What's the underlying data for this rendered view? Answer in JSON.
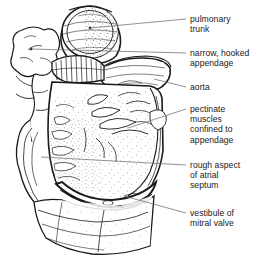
{
  "figure": {
    "width": 272,
    "height": 263,
    "background_color": "#ffffff",
    "ink_color": "#1a1a1a",
    "stipple_color": "#55555a",
    "leader_color": "#6e6e73"
  },
  "labels": [
    {
      "id": "pulmonary-trunk",
      "text": "pulmonary\ntrunk",
      "lines": [
        "pulmonary",
        "trunk"
      ],
      "x": 190,
      "y": 14,
      "leader": {
        "x1": 186,
        "y1": 19,
        "x2": 90,
        "y2": 28,
        "dot": true
      }
    },
    {
      "id": "narrow-hooked-appendage",
      "text": "narrow, hooked\nappendage",
      "lines": [
        "narrow, hooked",
        "appendage"
      ],
      "x": 190,
      "y": 48,
      "leader": {
        "x1": 186,
        "y1": 53,
        "x2": 31,
        "y2": 49,
        "dot": true
      }
    },
    {
      "id": "aorta",
      "text": "aorta",
      "lines": [
        "aorta"
      ],
      "x": 190,
      "y": 82,
      "leader": {
        "x1": 186,
        "y1": 87,
        "x2": 154,
        "y2": 79,
        "dot": false
      }
    },
    {
      "id": "pectinate-muscles",
      "text": "pectinate\nmuscles\nconfined to\nappendage",
      "lines": [
        "pectinate",
        "muscles",
        "confined to",
        "appendage"
      ],
      "x": 190,
      "y": 104,
      "leader": {
        "x1": 186,
        "y1": 109,
        "x2": 128,
        "y2": 128,
        "dot": false
      }
    },
    {
      "id": "rough-aspect-atrial-septum",
      "text": "rough aspect\nof atrial\nseptum",
      "lines": [
        "rough aspect",
        "of atrial",
        "septum"
      ],
      "x": 190,
      "y": 160,
      "leader": {
        "x1": 186,
        "y1": 165,
        "x2": 41,
        "y2": 157,
        "dot": false
      }
    },
    {
      "id": "vestibule-mitral-valve",
      "text": "vestibule of\nmitral valve",
      "lines": [
        "vestibule of",
        "mitral valve"
      ],
      "x": 190,
      "y": 208,
      "leader": {
        "x1": 186,
        "y1": 213,
        "x2": 124,
        "y2": 196,
        "dot": false
      }
    }
  ]
}
